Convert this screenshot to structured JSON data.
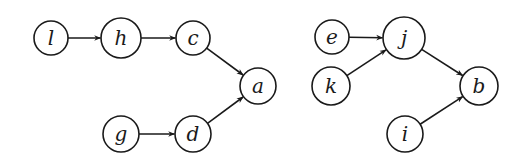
{
  "diagram": {
    "type": "directed-graph",
    "stroke_color": "#1a1a1a",
    "background": "#ffffff",
    "nodes": [
      {
        "id": "l",
        "label": "l",
        "x": 51,
        "y": 38,
        "r": 17
      },
      {
        "id": "h",
        "label": "h",
        "x": 121,
        "y": 38,
        "r": 20
      },
      {
        "id": "c",
        "label": "c",
        "x": 193,
        "y": 38,
        "r": 17
      },
      {
        "id": "a",
        "label": "a",
        "x": 258,
        "y": 86,
        "r": 18
      },
      {
        "id": "g",
        "label": "g",
        "x": 121,
        "y": 134,
        "r": 18
      },
      {
        "id": "d",
        "label": "d",
        "x": 193,
        "y": 134,
        "r": 18
      },
      {
        "id": "e",
        "label": "e",
        "x": 332,
        "y": 37,
        "r": 17
      },
      {
        "id": "j",
        "label": "j",
        "x": 404,
        "y": 38,
        "r": 21
      },
      {
        "id": "k",
        "label": "k",
        "x": 331,
        "y": 86,
        "r": 19
      },
      {
        "id": "b",
        "label": "b",
        "x": 479,
        "y": 86,
        "r": 19
      },
      {
        "id": "i",
        "label": "i",
        "x": 405,
        "y": 134,
        "r": 18
      }
    ],
    "edges": [
      {
        "from": "l",
        "to": "h"
      },
      {
        "from": "h",
        "to": "c"
      },
      {
        "from": "c",
        "to": "a"
      },
      {
        "from": "g",
        "to": "d"
      },
      {
        "from": "d",
        "to": "a"
      },
      {
        "from": "e",
        "to": "j"
      },
      {
        "from": "k",
        "to": "j"
      },
      {
        "from": "j",
        "to": "b"
      },
      {
        "from": "i",
        "to": "b"
      }
    ]
  }
}
